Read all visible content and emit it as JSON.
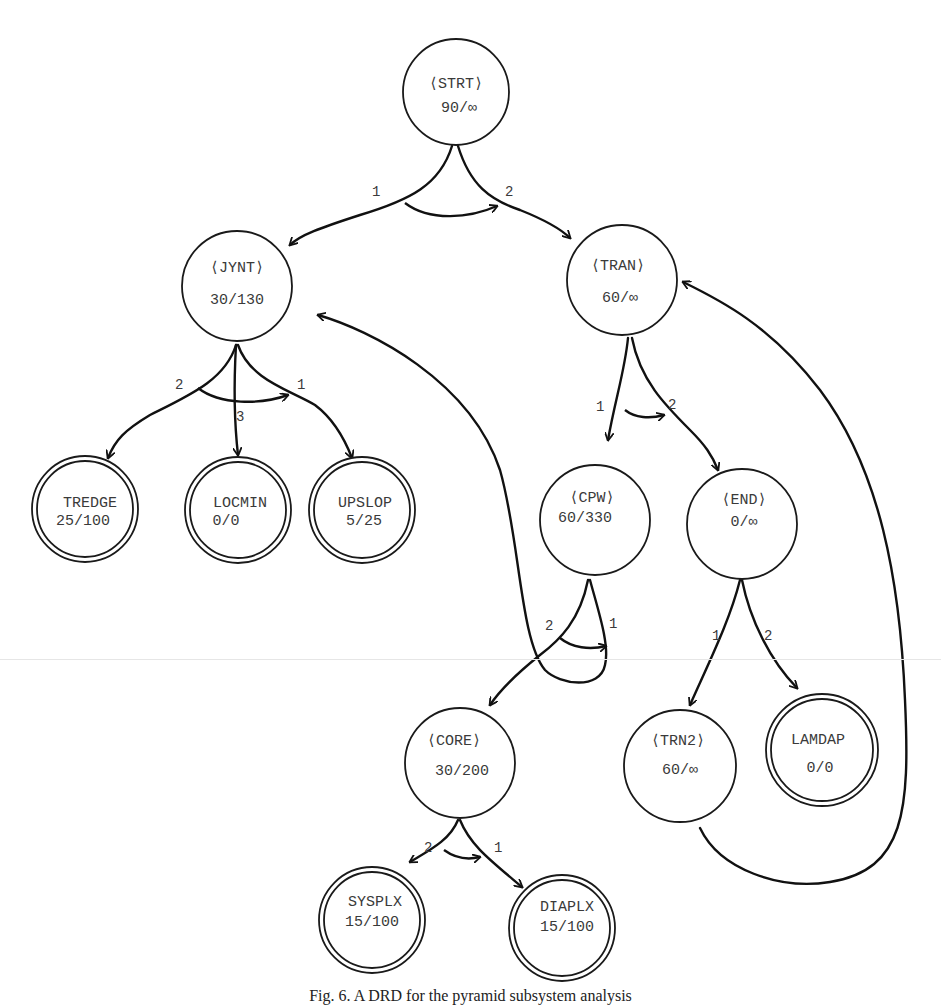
{
  "figure": {
    "caption": "Fig. 6. A DRD for the pyramid subsystem analysis"
  },
  "nodes": {
    "strt": {
      "name": "⟨STRT⟩",
      "value": "90/∞",
      "type": "intermediate"
    },
    "jynt": {
      "name": "⟨JYNT⟩",
      "value": "30/130",
      "type": "intermediate"
    },
    "tran": {
      "name": "⟨TRAN⟩",
      "value": "60/∞",
      "type": "intermediate"
    },
    "tredge": {
      "name": "TREDGE",
      "value": "25/100",
      "type": "terminal"
    },
    "locmin": {
      "name": "LOCMIN",
      "value": "0/0",
      "type": "terminal"
    },
    "upslop": {
      "name": "UPSLOP",
      "value": "5/25",
      "type": "terminal"
    },
    "cpw": {
      "name": "⟨CPW⟩",
      "value": "60/330",
      "type": "intermediate"
    },
    "end": {
      "name": "⟨END⟩",
      "value": "0/∞",
      "type": "intermediate"
    },
    "core": {
      "name": "⟨CORE⟩",
      "value": "30/200",
      "type": "intermediate"
    },
    "trn2": {
      "name": "⟨TRN2⟩",
      "value": "60/∞",
      "type": "intermediate"
    },
    "lamdap": {
      "name": "LAMDAP",
      "value": "0/0",
      "type": "terminal"
    },
    "sysplx": {
      "name": "SYSPLX",
      "value": "15/100",
      "type": "terminal"
    },
    "diaplx": {
      "name": "DIAPLX",
      "value": "15/100",
      "type": "terminal"
    }
  },
  "edge_labels": {
    "strt_jynt": "1",
    "strt_tran": "2",
    "jynt_tredge": "2",
    "jynt_locmin": "3",
    "jynt_upslop": "1",
    "tran_cpw": "1",
    "tran_end": "2",
    "cpw_core": "2",
    "cpw_jynt": "1",
    "end_trn2": "1",
    "end_lamdap": "2",
    "core_sysplx": "2",
    "core_diaplx": "1"
  },
  "edges": [
    {
      "from": "STRT",
      "to": "JYNT",
      "label": "1"
    },
    {
      "from": "STRT",
      "to": "TRAN",
      "label": "2"
    },
    {
      "from": "JYNT",
      "to": "TREDGE",
      "label": "2"
    },
    {
      "from": "JYNT",
      "to": "LOCMIN",
      "label": "3"
    },
    {
      "from": "JYNT",
      "to": "UPSLOP",
      "label": "1"
    },
    {
      "from": "TRAN",
      "to": "CPW",
      "label": "1"
    },
    {
      "from": "TRAN",
      "to": "END",
      "label": "2"
    },
    {
      "from": "CPW",
      "to": "CORE",
      "label": "2"
    },
    {
      "from": "CPW",
      "to": "JYNT",
      "label": "1"
    },
    {
      "from": "END",
      "to": "TRN2",
      "label": "1"
    },
    {
      "from": "END",
      "to": "LAMDAP",
      "label": "2"
    },
    {
      "from": "TRN2",
      "to": "TRAN",
      "label": ""
    },
    {
      "from": "CORE",
      "to": "SYSPLX",
      "label": "2"
    },
    {
      "from": "CORE",
      "to": "DIAPLX",
      "label": "1"
    }
  ],
  "colors": {
    "ink": "#111111",
    "text": "#3a3a3a",
    "background": "#ffffff"
  }
}
